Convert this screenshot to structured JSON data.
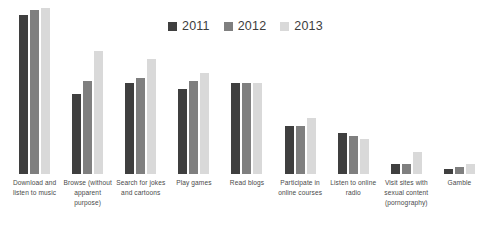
{
  "legend": {
    "position": "top-center",
    "entries": [
      {
        "label": "2011",
        "color": "#3f3f3f"
      },
      {
        "label": "2012",
        "color": "#7f7f7f"
      },
      {
        "label": "2013",
        "color": "#d9d9d9"
      }
    ]
  },
  "chart_data": {
    "type": "bar",
    "title": "",
    "subtitle": "",
    "xlabel": "",
    "ylabel": "",
    "ylim": [
      0,
      100
    ],
    "grid": false,
    "legend_position": "top-center",
    "categories": [
      "Download and listen to music",
      "Browse (without apparent purpose)",
      "Search for jokes and cartoons",
      "Play games",
      "Read blogs",
      "Participate in online courses",
      "Listen to online radio",
      "Visit sites with sexual content (pornography)",
      "Gamble"
    ],
    "series": [
      {
        "name": "2011",
        "color": "#3f3f3f",
        "values": [
          96,
          48,
          55,
          51,
          55,
          29,
          25,
          6,
          3
        ]
      },
      {
        "name": "2012",
        "color": "#7f7f7f",
        "values": [
          99,
          56,
          58,
          56,
          55,
          29,
          23,
          6,
          4
        ]
      },
      {
        "name": "2013",
        "color": "#d9d9d9",
        "values": [
          100,
          74,
          69,
          61,
          55,
          34,
          21,
          13,
          6
        ]
      }
    ]
  }
}
